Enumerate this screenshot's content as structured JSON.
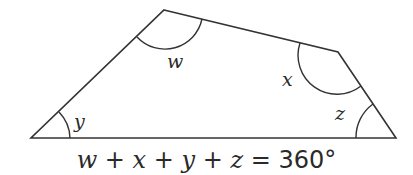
{
  "diagram": {
    "shape": "quadrilateral",
    "stroke_color": "#333333",
    "background": "#ffffff",
    "vertices": {
      "top_left": [
        164,
        10
      ],
      "top_right": [
        338,
        52
      ],
      "bottom_right": [
        396,
        138
      ],
      "bottom_left": [
        31,
        138
      ]
    },
    "angles": [
      {
        "label": "w",
        "vertex": "top_left"
      },
      {
        "label": "x",
        "vertex": "top_right"
      },
      {
        "label": "z",
        "vertex": "bottom_right"
      },
      {
        "label": "y",
        "vertex": "bottom_left"
      }
    ]
  },
  "caption": {
    "w": "w",
    "plus1": " + ",
    "x": "x",
    "plus2": " + ",
    "y": "y",
    "plus3": " + ",
    "z": "z",
    "equals": " = 360°"
  }
}
